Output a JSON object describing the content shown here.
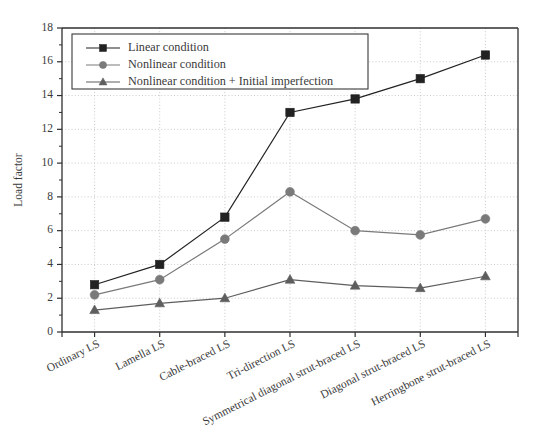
{
  "chart_data": {
    "type": "line",
    "title": "",
    "xlabel": "",
    "ylabel": "Load factor",
    "ylim": [
      0,
      18
    ],
    "ytick_step": 2,
    "yticks": [
      "0",
      "2",
      "4",
      "6",
      "8",
      "10",
      "12",
      "14",
      "16",
      "18"
    ],
    "grid": true,
    "legend_position": "top-left",
    "categories": [
      "Ordinary LS",
      "Lamella LS",
      "Cable-braced LS",
      "Tri-direction LS",
      "Symmetrical diagonal strut-braced LS",
      "Diagonal strut-braced LS",
      "Herringbone strut-braced LS"
    ],
    "series": [
      {
        "name": "Linear condition",
        "marker": "square",
        "color": "#222222",
        "values": [
          2.8,
          4.0,
          6.8,
          13.0,
          13.8,
          15.0,
          16.4
        ]
      },
      {
        "name": "Nonlinear condition",
        "marker": "circle",
        "color": "#7a7a7a",
        "values": [
          2.2,
          3.1,
          5.5,
          8.3,
          6.0,
          5.75,
          6.7
        ]
      },
      {
        "name": "Nonlinear condition + Initial imperfection",
        "marker": "triangle",
        "color": "#5e5e5e",
        "values": [
          1.3,
          1.7,
          2.0,
          3.1,
          2.75,
          2.6,
          3.3
        ]
      }
    ]
  },
  "legend": {
    "entries": [
      "Linear condition",
      "Nonlinear condition",
      "Nonlinear condition + Initial imperfection"
    ]
  }
}
